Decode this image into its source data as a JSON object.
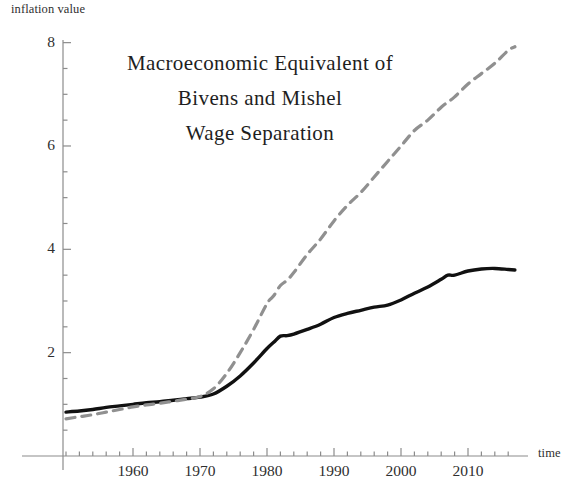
{
  "chart_data": {
    "type": "line",
    "title": "Macroeconomic Equivalent of\nBivens and Mishel\nWage Separation",
    "title_lines": [
      "Macroeconomic Equivalent of",
      "Bivens and Mishel",
      "Wage Separation"
    ],
    "xlabel": "time",
    "ylabel": "inflation value",
    "xlim": [
      1949,
      2018
    ],
    "ylim": [
      0,
      8.4
    ],
    "grid": false,
    "legend": "none",
    "y_ticks_major": [
      2,
      4,
      6,
      8
    ],
    "y_ticks_major_labels": [
      "2",
      "4",
      "6",
      "8"
    ],
    "y_ticks_minor": [
      0.5,
      1,
      1.5,
      2.5,
      3,
      3.5,
      4.5,
      5,
      5.5,
      6.5,
      7,
      7.5
    ],
    "x_ticks_major": [
      1960,
      1970,
      1980,
      1990,
      2000,
      2010
    ],
    "x_ticks_major_labels": [
      "1960",
      "1970",
      "1980",
      "1990",
      "2000",
      "2010"
    ],
    "x_ticks_minor_step": 2,
    "axis_color": "#8c8c8c",
    "series": [
      {
        "name": "solid-series",
        "style": "solid",
        "color": "#111111",
        "width": 3.4,
        "x": [
          1950,
          1952,
          1954,
          1956,
          1958,
          1960,
          1962,
          1964,
          1966,
          1968,
          1970,
          1972,
          1974,
          1976,
          1978,
          1980,
          1981,
          1982,
          1983,
          1984,
          1986,
          1988,
          1990,
          1992,
          1994,
          1996,
          1998,
          2000,
          2002,
          2004,
          2006,
          2007,
          2008,
          2010,
          2012,
          2014,
          2016,
          2017
        ],
        "y": [
          0.85,
          0.87,
          0.9,
          0.94,
          0.97,
          1.0,
          1.03,
          1.05,
          1.08,
          1.11,
          1.14,
          1.2,
          1.35,
          1.55,
          1.8,
          2.08,
          2.2,
          2.32,
          2.33,
          2.36,
          2.45,
          2.55,
          2.68,
          2.76,
          2.82,
          2.88,
          2.92,
          3.02,
          3.15,
          3.27,
          3.42,
          3.5,
          3.5,
          3.58,
          3.62,
          3.63,
          3.61,
          3.6
        ]
      },
      {
        "name": "dashed-series",
        "style": "dashed",
        "color": "#909090",
        "width": 3.2,
        "x": [
          1950,
          1952,
          1954,
          1956,
          1958,
          1960,
          1962,
          1964,
          1966,
          1968,
          1970,
          1972,
          1974,
          1976,
          1978,
          1980,
          1981,
          1982,
          1983,
          1984,
          1986,
          1988,
          1990,
          1992,
          1994,
          1996,
          1998,
          2000,
          2002,
          2004,
          2006,
          2007,
          2008,
          2010,
          2012,
          2014,
          2016,
          2017
        ],
        "y": [
          0.72,
          0.76,
          0.8,
          0.85,
          0.9,
          0.95,
          0.99,
          1.02,
          1.06,
          1.1,
          1.15,
          1.3,
          1.6,
          2.0,
          2.45,
          2.95,
          3.1,
          3.3,
          3.4,
          3.55,
          3.9,
          4.2,
          4.55,
          4.85,
          5.1,
          5.4,
          5.7,
          6.0,
          6.3,
          6.5,
          6.75,
          6.85,
          6.95,
          7.2,
          7.4,
          7.6,
          7.85,
          7.92
        ]
      }
    ]
  },
  "plot_geometry": {
    "x_axis_y_px": 456,
    "y_axis_x_px": 63,
    "x_px_per_year": 6.7,
    "x_px_year_1960": 133,
    "y_px_per_unit": 51.67,
    "y_px_value_0": 456
  }
}
